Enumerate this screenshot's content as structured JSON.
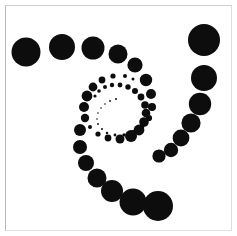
{
  "figure": {
    "title": "",
    "width": 237,
    "height": 236,
    "background_color": "#ffffff",
    "frame": {
      "name": "plot-frame",
      "x": 5,
      "y": 5,
      "width": 227,
      "height": 226,
      "border_color": "#cccccc",
      "border_width": 1,
      "fill_color": "#ffffff"
    }
  },
  "chart_data": {
    "type": "scatter",
    "title": "",
    "subtitle": "",
    "xlabel": "",
    "ylabel": "",
    "xlim": [
      0,
      237
    ],
    "ylim": [
      236,
      0
    ],
    "grid": false,
    "legend": null,
    "axes_visible": false,
    "tick_labels_visible": false,
    "marker_color": "#0d0d0d",
    "marker_shape": "circle",
    "center": {
      "x": 120,
      "y": 107
    },
    "points": [
      {
        "x": 26,
        "y": 52,
        "r": 14.5
      },
      {
        "x": 62,
        "y": 47,
        "r": 13.0
      },
      {
        "x": 93,
        "y": 48,
        "r": 11.5
      },
      {
        "x": 118,
        "y": 54,
        "r": 9.5
      },
      {
        "x": 135,
        "y": 65,
        "r": 7.6
      },
      {
        "x": 146,
        "y": 80,
        "r": 6.2
      },
      {
        "x": 151,
        "y": 94,
        "r": 5.0
      },
      {
        "x": 152,
        "y": 107,
        "r": 4.0
      },
      {
        "x": 149,
        "y": 118,
        "r": 3.1
      },
      {
        "x": 142,
        "y": 126,
        "r": 2.5
      },
      {
        "x": 133,
        "y": 132,
        "r": 2.0
      },
      {
        "x": 124,
        "y": 135,
        "r": 1.7
      },
      {
        "x": 115,
        "y": 135,
        "r": 1.4
      },
      {
        "x": 107,
        "y": 133,
        "r": 1.2
      },
      {
        "x": 102,
        "y": 129,
        "r": 1.0
      },
      {
        "x": 98,
        "y": 124,
        "r": 0.9
      },
      {
        "x": 97,
        "y": 119,
        "r": 0.8
      },
      {
        "x": 98,
        "y": 113,
        "r": 0.8
      },
      {
        "x": 101,
        "y": 108,
        "r": 0.8
      },
      {
        "x": 105,
        "y": 104,
        "r": 0.8
      },
      {
        "x": 110,
        "y": 101,
        "r": 0.9
      },
      {
        "x": 116,
        "y": 99,
        "r": 1.0
      },
      {
        "x": 95,
        "y": 96,
        "r": 1.6
      },
      {
        "x": 99,
        "y": 91,
        "r": 1.8
      },
      {
        "x": 105,
        "y": 87,
        "r": 2.0
      },
      {
        "x": 112,
        "y": 85,
        "r": 2.2
      },
      {
        "x": 120,
        "y": 85,
        "r": 2.4
      },
      {
        "x": 128,
        "y": 87,
        "r": 2.7
      },
      {
        "x": 135,
        "y": 91,
        "r": 3.0
      },
      {
        "x": 141,
        "y": 97,
        "r": 3.4
      },
      {
        "x": 145,
        "y": 105,
        "r": 3.8
      },
      {
        "x": 146,
        "y": 113,
        "r": 4.3
      },
      {
        "x": 144,
        "y": 122,
        "r": 4.8
      },
      {
        "x": 139,
        "y": 130,
        "r": 5.4
      },
      {
        "x": 131,
        "y": 136,
        "r": 6.0
      },
      {
        "x": 120,
        "y": 139,
        "r": 4.5
      },
      {
        "x": 108,
        "y": 138,
        "r": 3.4
      },
      {
        "x": 98,
        "y": 134,
        "r": 2.6
      },
      {
        "x": 90,
        "y": 127,
        "r": 2.0
      },
      {
        "x": 85,
        "y": 118,
        "r": 4.2
      },
      {
        "x": 84,
        "y": 107,
        "r": 5.0
      },
      {
        "x": 87,
        "y": 96,
        "r": 5.4
      },
      {
        "x": 93,
        "y": 87,
        "r": 4.4
      },
      {
        "x": 102,
        "y": 80,
        "r": 3.4
      },
      {
        "x": 113,
        "y": 76,
        "r": 2.6
      },
      {
        "x": 125,
        "y": 76,
        "r": 2.0
      },
      {
        "x": 133,
        "y": 79,
        "r": 1.5
      },
      {
        "x": 80,
        "y": 130,
        "r": 6.0
      },
      {
        "x": 80,
        "y": 147,
        "r": 7.0
      },
      {
        "x": 86,
        "y": 163,
        "r": 8.0
      },
      {
        "x": 97,
        "y": 178,
        "r": 9.5
      },
      {
        "x": 112,
        "y": 191,
        "r": 11.0
      },
      {
        "x": 133,
        "y": 202,
        "r": 13.5
      },
      {
        "x": 158,
        "y": 206,
        "r": 15.0
      },
      {
        "x": 159,
        "y": 156,
        "r": 6.6
      },
      {
        "x": 171,
        "y": 150,
        "r": 7.2
      },
      {
        "x": 181,
        "y": 138,
        "r": 8.4
      },
      {
        "x": 191,
        "y": 123,
        "r": 9.6
      },
      {
        "x": 200,
        "y": 104,
        "r": 11.2
      },
      {
        "x": 204,
        "y": 78,
        "r": 13.0
      },
      {
        "x": 204,
        "y": 40,
        "r": 16.0
      }
    ]
  }
}
